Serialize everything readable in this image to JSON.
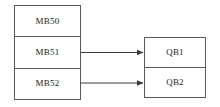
{
  "diagram": {
    "background_color": "#ffffff",
    "stroke_color": "#58585a",
    "text_color": "#1a1a1a",
    "source_block": {
      "name": "memory-byte-block",
      "cells": [
        {
          "label": "MB50"
        },
        {
          "label": "MB51"
        },
        {
          "label": "MB52"
        }
      ]
    },
    "target_block": {
      "name": "output-byte-block",
      "cells": [
        {
          "label": "QB1"
        },
        {
          "label": "QB2"
        }
      ]
    },
    "connections": [
      {
        "from": "MB51",
        "to": "QB1",
        "style": "arrow"
      },
      {
        "from": "MB52",
        "to": "QB2",
        "style": "arrow"
      }
    ]
  }
}
